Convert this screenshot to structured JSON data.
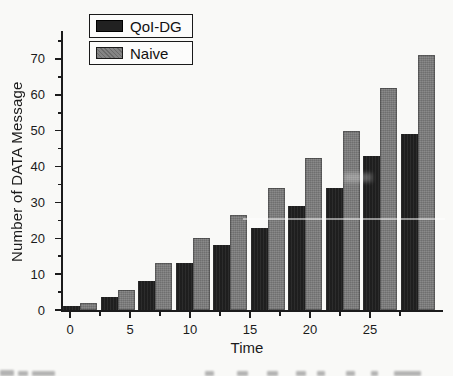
{
  "chart_data": {
    "type": "bar",
    "title": "",
    "xlabel": "Time",
    "ylabel": "Number of DATA Message",
    "categories": [
      0,
      3,
      6,
      9,
      12,
      15,
      18,
      21,
      24,
      27
    ],
    "series": [
      {
        "name": "QoI-DG",
        "color": "#212121",
        "values": [
          1,
          3.5,
          8,
          13,
          18,
          23,
          29,
          34,
          43,
          49
        ]
      },
      {
        "name": "Naive",
        "color": "#7c7c7c",
        "values": [
          2,
          5.5,
          13,
          20,
          26.5,
          34,
          42.5,
          50,
          62,
          71
        ]
      }
    ],
    "ylim": [
      0,
      75
    ],
    "xlim": [
      -1,
      31
    ],
    "y_ticks_major": [
      0,
      10,
      20,
      30,
      40,
      50,
      60,
      70
    ],
    "y_minor_step": 5,
    "x_ticks_major": [
      0,
      5,
      10,
      15,
      20,
      25
    ],
    "x_minor_step": 2.5,
    "x_tick_max": 27.5,
    "grid": false,
    "legend_position": "top-left",
    "axis_color": "#1c1c1c",
    "background_color": "#f9f9f7"
  }
}
